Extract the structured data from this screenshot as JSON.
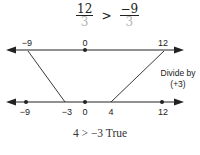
{
  "equation": {
    "left": {
      "numerator": "12",
      "denominator": "3"
    },
    "operator": ">",
    "right": {
      "numerator": "−9",
      "denominator": "3"
    }
  },
  "top_line": {
    "labels": [
      "−9",
      "0",
      "12"
    ],
    "values": [
      -9,
      0,
      12
    ],
    "dots": [
      0
    ]
  },
  "bottom_line": {
    "labels": [
      "−9",
      "−3",
      "0",
      "4",
      "12"
    ],
    "values": [
      -9,
      -3,
      0,
      4,
      12
    ],
    "dots": [
      -9,
      0,
      12
    ]
  },
  "annotation": {
    "line1": "Divide by",
    "line2": "(+3)"
  },
  "result": "4 > −3 True",
  "colors": {
    "line": "#222222",
    "denominator": "#b5b5b5"
  }
}
